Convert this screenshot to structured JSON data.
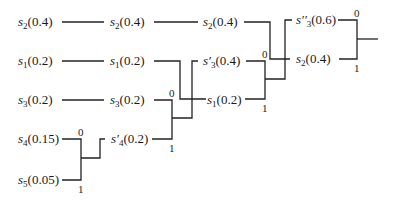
{
  "diagram": {
    "type": "huffman-coding-tree",
    "columns": [
      {
        "nodes": [
          {
            "symbol": "s",
            "sub": "2",
            "prime": "",
            "prob": "(0.4)"
          },
          {
            "symbol": "s",
            "sub": "1",
            "prime": "",
            "prob": "(0.2)"
          },
          {
            "symbol": "s",
            "sub": "3",
            "prime": "",
            "prob": "(0.2)"
          },
          {
            "symbol": "s",
            "sub": "4",
            "prime": "",
            "prob": "(0.15)"
          },
          {
            "symbol": "s",
            "sub": "5",
            "prime": "",
            "prob": "(0.05)"
          }
        ]
      },
      {
        "nodes": [
          {
            "symbol": "s",
            "sub": "2",
            "prime": "",
            "prob": "(0.4)"
          },
          {
            "symbol": "s",
            "sub": "1",
            "prime": "",
            "prob": "(0.2)"
          },
          {
            "symbol": "s",
            "sub": "3",
            "prime": "",
            "prob": "(0.2)"
          },
          {
            "symbol": "s",
            "sub": "4",
            "prime": "′",
            "prob": "(0.2)"
          }
        ]
      },
      {
        "nodes": [
          {
            "symbol": "s",
            "sub": "2",
            "prime": "",
            "prob": "(0.4)"
          },
          {
            "symbol": "s",
            "sub": "3",
            "prime": "′",
            "prob": "(0.4)"
          },
          {
            "symbol": "s",
            "sub": "1",
            "prime": "",
            "prob": "(0.2)"
          }
        ]
      },
      {
        "nodes": [
          {
            "symbol": "s",
            "sub": "3",
            "prime": "′′",
            "prob": "(0.6)"
          },
          {
            "symbol": "s",
            "sub": "2",
            "prime": "",
            "prob": "(0.4)"
          }
        ]
      }
    ],
    "merge_bits": {
      "m1_zero": "0",
      "m1_one": "1",
      "m2_zero": "0",
      "m2_one": "1",
      "m3_zero": "0",
      "m3_one": "1",
      "m4_zero": "0",
      "m4_one": "1"
    }
  }
}
